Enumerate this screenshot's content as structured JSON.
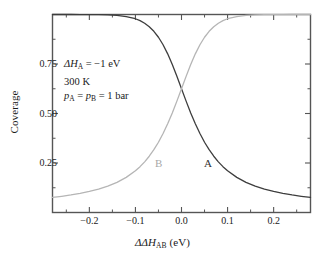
{
  "chart_data": {
    "type": "line",
    "title": "",
    "xlabel": "ΔΔH_AB (eV)",
    "ylabel": "Coverage",
    "xlim": [
      -0.28,
      0.28
    ],
    "ylim": [
      0.0,
      1.0
    ],
    "xticks": [
      -0.2,
      -0.1,
      0.0,
      0.1,
      0.2
    ],
    "xticklabels": [
      "−0.2",
      "−0.1",
      "0.0",
      "0.1",
      "0.2"
    ],
    "yticks": [
      0.25,
      0.5,
      0.75
    ],
    "yticklabels": [
      "0.25",
      "0.50",
      "0.75"
    ],
    "xminorticks": [
      -0.25,
      -0.15,
      -0.05,
      0.05,
      0.15,
      0.25
    ],
    "yminorticks": [
      0.125,
      0.375,
      0.625,
      0.875
    ],
    "grid": false,
    "legend_position": "inline-curve-labels",
    "frame": "box",
    "tick_direction": "in",
    "series": [
      {
        "name": "A",
        "color": "#3d3d3d",
        "linewidth": 1.3,
        "x": [
          -0.28,
          -0.26,
          -0.24,
          -0.22,
          -0.2,
          -0.18,
          -0.16,
          -0.14,
          -0.12,
          -0.1,
          -0.09,
          -0.08,
          -0.07,
          -0.06,
          -0.05,
          -0.04,
          -0.03,
          -0.02,
          -0.01,
          0.0,
          0.01,
          0.02,
          0.03,
          0.04,
          0.05,
          0.06,
          0.07,
          0.08,
          0.09,
          0.1,
          0.12,
          0.14,
          0.16,
          0.18,
          0.2,
          0.22,
          0.24,
          0.26,
          0.28
        ],
        "y": [
          1.0,
          1.0,
          1.0,
          0.9998,
          0.9996,
          0.999,
          0.9978,
          0.9952,
          0.9894,
          0.9786,
          0.9689,
          0.9558,
          0.9382,
          0.9151,
          0.8851,
          0.8473,
          0.8012,
          0.7474,
          0.6876,
          0.625,
          0.5626,
          0.5026,
          0.4478,
          0.3987,
          0.3549,
          0.3171,
          0.2842,
          0.2559,
          0.2315,
          0.2105,
          0.1774,
          0.1525,
          0.1334,
          0.1184,
          0.1064,
          0.0966,
          0.0885,
          0.0817,
          0.0759
        ]
      },
      {
        "name": "B",
        "color": "#b5b5b5",
        "linewidth": 1.3,
        "x": [
          -0.28,
          -0.26,
          -0.24,
          -0.22,
          -0.2,
          -0.18,
          -0.16,
          -0.14,
          -0.12,
          -0.1,
          -0.09,
          -0.08,
          -0.07,
          -0.06,
          -0.05,
          -0.04,
          -0.03,
          -0.02,
          -0.01,
          0.0,
          0.01,
          0.02,
          0.03,
          0.04,
          0.05,
          0.06,
          0.07,
          0.08,
          0.09,
          0.1,
          0.12,
          0.14,
          0.16,
          0.18,
          0.2,
          0.22,
          0.24,
          0.26,
          0.28
        ],
        "y": [
          0.0759,
          0.0817,
          0.0885,
          0.0966,
          0.1064,
          0.1184,
          0.1334,
          0.1525,
          0.1774,
          0.2105,
          0.2315,
          0.2559,
          0.2842,
          0.3171,
          0.3549,
          0.3987,
          0.4478,
          0.5026,
          0.5626,
          0.625,
          0.6876,
          0.7474,
          0.8012,
          0.8473,
          0.8851,
          0.9151,
          0.9382,
          0.9558,
          0.9689,
          0.9786,
          0.9894,
          0.9952,
          0.9978,
          0.999,
          0.9996,
          0.9998,
          1.0,
          1.0,
          1.0
        ]
      }
    ],
    "annotations": [
      {
        "name": "enthalpy",
        "text": "ΔH_A = −1 eV"
      },
      {
        "name": "temperature",
        "text": "300 K"
      },
      {
        "name": "pressure",
        "text": "p_A = p_B = 1 bar"
      }
    ],
    "curve_labels": [
      {
        "name": "A",
        "text": "A"
      },
      {
        "name": "B",
        "text": "B"
      }
    ]
  },
  "axes": {
    "xlabel_parts": {
      "delta": "ΔΔH",
      "sub": "AB",
      "unit": " (eV)"
    },
    "ylabel": "Coverage"
  },
  "annotation": {
    "line1": {
      "sym": "ΔH",
      "sub": "A",
      "rest": " = −1 eV"
    },
    "line2": "300 K",
    "line3": {
      "p1": "p",
      "sub1": "A",
      "eq1": " = ",
      "p2": "p",
      "sub2": "B",
      "rest": " = 1 bar"
    }
  },
  "curve_labels": {
    "a": "A",
    "b": "B"
  },
  "ticks": {
    "x": [
      "−0.2",
      "−0.1",
      "0.0",
      "0.1",
      "0.2"
    ],
    "y": [
      "0.75",
      "0.50",
      "0.25"
    ]
  },
  "colors": {
    "curve_a": "#3d3d3d",
    "curve_b": "#b5b5b5",
    "axis": "#555555",
    "text": "#1a1a1a"
  }
}
